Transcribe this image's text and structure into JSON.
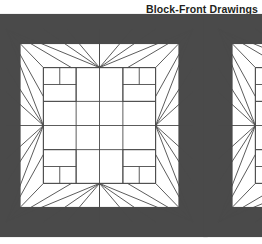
{
  "page": {
    "background_color": "#ffffff",
    "width": 262,
    "height": 244
  },
  "header": {
    "title": "Block-Front Drawings"
  },
  "figure": {
    "caption": "Block-Front Drawings",
    "line_color": "#4a4a4a",
    "fill_color": "#ffffff",
    "block_count": 2,
    "blocks": [
      {
        "name": "quilt-block-primary",
        "label": "Block-Front Drawing 1",
        "x": 6,
        "y": 29,
        "width": 187,
        "height": 193,
        "clipped": false
      },
      {
        "name": "quilt-block-secondary",
        "label": "Block-Front Drawing 2",
        "x": 218,
        "y": 29,
        "width": 187,
        "height": 193,
        "clipped": true
      }
    ],
    "grid": {
      "divisions": 8,
      "description": "Eight-by-eight patchwork grid with central cross, four corner fan triangles, four edge chevrons and four inner nine-patch corner squares"
    },
    "motifs": [
      "corner-fan-triangles",
      "edge-chevron-arrows",
      "center-cross",
      "inner-corner-squares"
    ]
  }
}
